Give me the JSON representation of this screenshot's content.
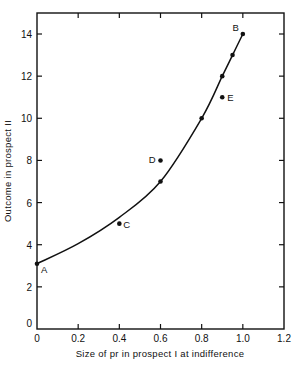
{
  "chart_data": {
    "type": "scatter",
    "title": "",
    "xlabel": "Size of pr in prospect I at indifference",
    "ylabel": "Outcome in prospect II",
    "xlim": [
      0,
      1.2
    ],
    "ylim": [
      0,
      15
    ],
    "x_ticks": [
      0,
      0.2,
      0.4,
      0.6,
      0.8,
      1.0,
      1.2
    ],
    "x_tick_labels": [
      "0",
      "0.2",
      "0.4",
      "0.6",
      "0.8",
      "1.0",
      "1.2"
    ],
    "y_ticks": [
      0,
      2,
      4,
      6,
      8,
      10,
      12,
      14
    ],
    "y_tick_labels": [
      "0",
      "2",
      "4",
      "6",
      "8",
      "10",
      "12",
      "14"
    ],
    "grid": false,
    "legend": null,
    "series": [
      {
        "name": "observed points",
        "points": [
          {
            "x": 0.0,
            "y": 3.1,
            "label": "A"
          },
          {
            "x": 0.4,
            "y": 5.0,
            "label": "C"
          },
          {
            "x": 0.6,
            "y": 7.0,
            "label": ""
          },
          {
            "x": 0.6,
            "y": 8.0,
            "label": "D"
          },
          {
            "x": 0.8,
            "y": 10.0,
            "label": ""
          },
          {
            "x": 0.9,
            "y": 11.0,
            "label": "E"
          },
          {
            "x": 0.9,
            "y": 12.0,
            "label": ""
          },
          {
            "x": 0.95,
            "y": 13.0,
            "label": ""
          },
          {
            "x": 1.0,
            "y": 14.0,
            "label": "B"
          }
        ]
      },
      {
        "name": "fitted curve",
        "type": "line",
        "points": [
          {
            "x": 0.0,
            "y": 3.1
          },
          {
            "x": 0.2,
            "y": 4.05
          },
          {
            "x": 0.4,
            "y": 5.3
          },
          {
            "x": 0.6,
            "y": 7.0
          },
          {
            "x": 0.8,
            "y": 10.0
          },
          {
            "x": 0.9,
            "y": 12.0
          },
          {
            "x": 0.95,
            "y": 13.0
          },
          {
            "x": 1.0,
            "y": 14.0
          }
        ]
      }
    ]
  }
}
